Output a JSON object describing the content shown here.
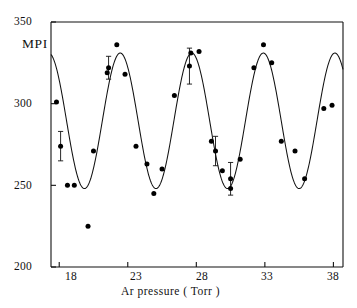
{
  "chart_data": {
    "type": "scatter",
    "title": "",
    "xlabel": "Ar pressure ( Torr )",
    "ylabel": "MPI",
    "xlim": [
      17.4,
      38.7
    ],
    "ylim": [
      200,
      350
    ],
    "xticks": [
      18,
      23,
      28,
      33,
      38
    ],
    "yticks": [
      200,
      250,
      300,
      350
    ],
    "xtick_labels": [
      "18",
      "23",
      "28",
      "33",
      "38"
    ],
    "ytick_labels": [
      "200",
      "250",
      "300",
      "350"
    ],
    "grid": false,
    "legend": null,
    "marker": "filled-circle",
    "marker_color": "#000000",
    "line_color": "#000000",
    "frame": "box",
    "series": [
      {
        "name": "MPI signal",
        "type": "scatter",
        "points": [
          {
            "x": 17.8,
            "y": 301,
            "err": 0
          },
          {
            "x": 18.1,
            "y": 274,
            "err": 9
          },
          {
            "x": 18.6,
            "y": 250,
            "err": 0
          },
          {
            "x": 19.1,
            "y": 250,
            "err": 0
          },
          {
            "x": 20.1,
            "y": 225,
            "err": 0
          },
          {
            "x": 20.5,
            "y": 271,
            "err": 0
          },
          {
            "x": 21.5,
            "y": 319,
            "err": 0
          },
          {
            "x": 21.6,
            "y": 322,
            "err": 7
          },
          {
            "x": 22.2,
            "y": 336,
            "err": 0
          },
          {
            "x": 22.8,
            "y": 318,
            "err": 0
          },
          {
            "x": 23.6,
            "y": 274,
            "err": 0
          },
          {
            "x": 24.4,
            "y": 263,
            "err": 0
          },
          {
            "x": 24.9,
            "y": 245,
            "err": 0
          },
          {
            "x": 25.5,
            "y": 260,
            "err": 0
          },
          {
            "x": 26.4,
            "y": 305,
            "err": 0
          },
          {
            "x": 27.5,
            "y": 323,
            "err": 11
          },
          {
            "x": 27.6,
            "y": 331,
            "err": 0
          },
          {
            "x": 28.2,
            "y": 332,
            "err": 0
          },
          {
            "x": 29.1,
            "y": 277,
            "err": 0
          },
          {
            "x": 29.4,
            "y": 271,
            "err": 9
          },
          {
            "x": 29.9,
            "y": 259,
            "err": 0
          },
          {
            "x": 30.5,
            "y": 254,
            "err": 10
          },
          {
            "x": 30.5,
            "y": 248,
            "err": 0
          },
          {
            "x": 31.2,
            "y": 266,
            "err": 0
          },
          {
            "x": 32.2,
            "y": 322,
            "err": 0
          },
          {
            "x": 32.9,
            "y": 336,
            "err": 0
          },
          {
            "x": 33.5,
            "y": 325,
            "err": 0
          },
          {
            "x": 34.2,
            "y": 277,
            "err": 0
          },
          {
            "x": 35.2,
            "y": 271,
            "err": 0
          },
          {
            "x": 35.9,
            "y": 254,
            "err": 0
          },
          {
            "x": 37.3,
            "y": 297,
            "err": 0
          },
          {
            "x": 37.9,
            "y": 299,
            "err": 0
          }
        ]
      },
      {
        "name": "sinusoidal fit",
        "type": "line",
        "fit": {
          "mean": 289.5,
          "amplitude": 41.5,
          "period": 5.22,
          "phase_x_peak": 22.45
        }
      }
    ]
  }
}
